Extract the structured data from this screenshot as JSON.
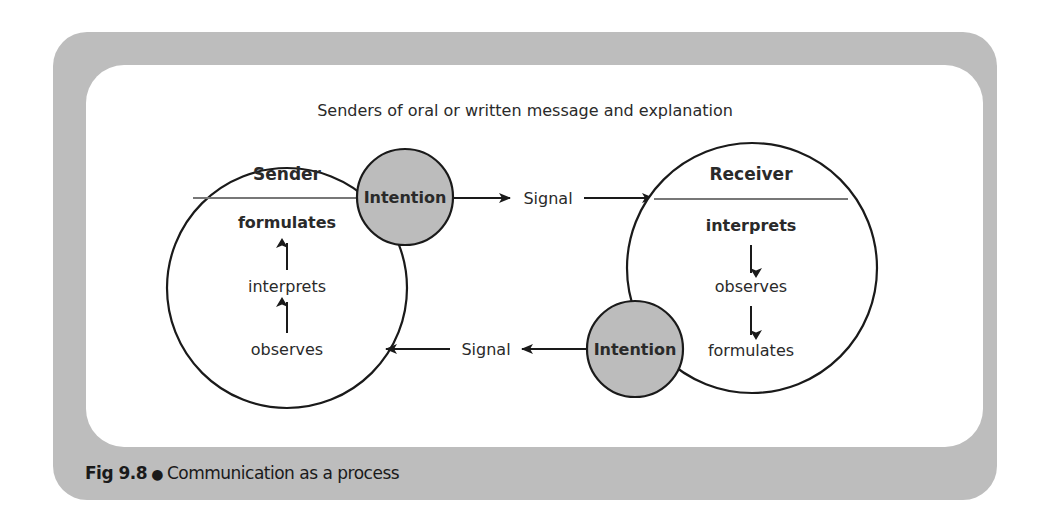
{
  "diagram": {
    "title": "Senders of oral or written message and explanation",
    "sender": {
      "label": "Sender",
      "steps": [
        "formulates",
        "interprets",
        "observes"
      ],
      "intention_label": "Intention"
    },
    "receiver": {
      "label": "Receiver",
      "steps": [
        "interprets",
        "observes",
        "formulates"
      ],
      "intention_label": "Intention"
    },
    "signals": {
      "top": "Signal",
      "bottom": "Signal"
    },
    "colors": {
      "frame": "#bdbdbd",
      "panel": "#ffffff",
      "intention_fill": "#bcbcbc",
      "stroke": "#1a1a1a"
    }
  },
  "caption": {
    "figure_number": "Fig 9.8",
    "bullet": "●",
    "text": "Communication as a process"
  }
}
